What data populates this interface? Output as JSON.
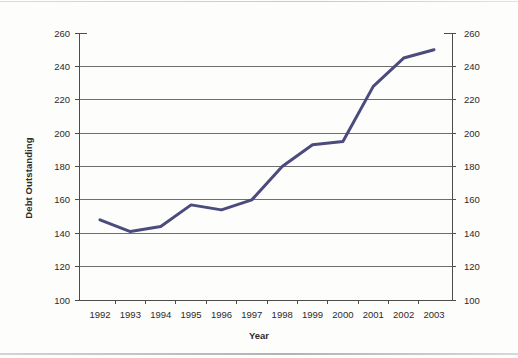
{
  "chart_data": {
    "type": "line",
    "title": "",
    "xlabel": "Year",
    "ylabel": "Debt Outstanding",
    "categories": [
      "1992",
      "1993",
      "1994",
      "1995",
      "1996",
      "1997",
      "1998",
      "1999",
      "2000",
      "2001",
      "2002",
      "2003"
    ],
    "values": [
      148,
      141,
      144,
      157,
      154,
      160,
      180,
      193,
      195,
      228,
      245,
      250
    ],
    "series": [
      {
        "name": "Debt Outstanding",
        "color": "#4b4b7d",
        "values": [
          148,
          141,
          144,
          157,
          154,
          160,
          180,
          193,
          195,
          228,
          245,
          250
        ]
      }
    ],
    "ylim": [
      100,
      260
    ],
    "yticks": [
      100,
      120,
      140,
      160,
      180,
      200,
      220,
      240,
      260
    ],
    "ytick_labels_left": [
      "100",
      "120",
      "140",
      "160",
      "180",
      "200",
      "220",
      "240",
      "260"
    ],
    "ytick_labels_right": [
      "100",
      "120",
      "140",
      "160",
      "180",
      "200",
      "220",
      "240",
      "260"
    ],
    "xtick_labels": [
      "1992",
      "1993",
      "1994",
      "1995",
      "1996",
      "1997",
      "1998",
      "1999",
      "2000",
      "2001",
      "2002",
      "2003"
    ],
    "grid": true,
    "grid_axis": "y",
    "grid_color": "#6e6e6e",
    "legend": false,
    "legend_position": "none",
    "dual_y_axis": true,
    "axis_color": "#4d4d4d",
    "background": "#ffffff"
  },
  "figure": {
    "y_axis_title": "Debt Outstanding",
    "x_axis_title": "Year"
  }
}
